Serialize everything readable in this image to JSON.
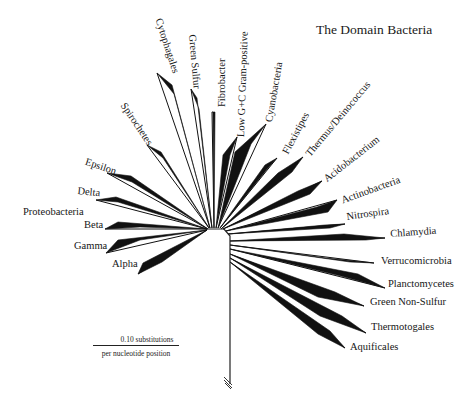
{
  "title": "The Domain Bacteria",
  "scale_bar": {
    "value_label": "0.10 substitutions",
    "unit_label": "per nucleotide position"
  },
  "group_label": "Proteobacteria",
  "taxa": [
    {
      "name": "Alpha",
      "group": "Proteobacteria"
    },
    {
      "name": "Gamma",
      "group": "Proteobacteria"
    },
    {
      "name": "Beta",
      "group": "Proteobacteria"
    },
    {
      "name": "Delta",
      "group": "Proteobacteria"
    },
    {
      "name": "Epsilon",
      "group": "Proteobacteria"
    },
    {
      "name": "Spirochetes"
    },
    {
      "name": "Cytophagales"
    },
    {
      "name": "Green Sulfur"
    },
    {
      "name": "Fibrobacter"
    },
    {
      "name": "Low G+C Gram-positive"
    },
    {
      "name": "Cyanobacteria"
    },
    {
      "name": "Flexistipes"
    },
    {
      "name": "Thermus/Deinococcus"
    },
    {
      "name": "Acidobacterium"
    },
    {
      "name": "Actinobacteria"
    },
    {
      "name": "Nitrospira"
    },
    {
      "name": "Chlamydia"
    },
    {
      "name": "Verrucomicrobia"
    },
    {
      "name": "Planctomycetes"
    },
    {
      "name": "Green Non-Sulfur"
    },
    {
      "name": "Thermotogales"
    },
    {
      "name": "Aquificales"
    }
  ],
  "colors": {
    "branch": "#111111",
    "text": "#161616"
  }
}
